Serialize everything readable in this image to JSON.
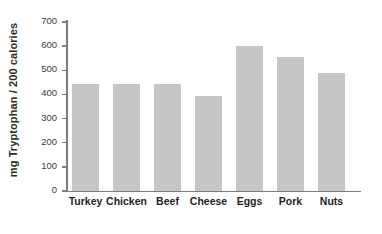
{
  "chart_data": {
    "type": "bar",
    "title": "",
    "xlabel": "",
    "ylabel": "mg Tryptophan / 200 calories",
    "categories": [
      "Turkey",
      "Chicken",
      "Beef",
      "Cheese",
      "Eggs",
      "Pork",
      "Nuts"
    ],
    "values": [
      445,
      445,
      445,
      395,
      600,
      555,
      490
    ],
    "ylim": [
      0,
      700
    ],
    "yticks": [
      "0",
      "100",
      "200",
      "300",
      "400",
      "500",
      "600",
      "700"
    ],
    "ytick_values": [
      0,
      100,
      200,
      300,
      400,
      500,
      600,
      700
    ],
    "grid": false,
    "legend": false,
    "bar_color": "#c6c6c6",
    "axis_color": "#7d7d7d",
    "background_color": "#ffffff",
    "text_color": "#1f1f1f"
  }
}
